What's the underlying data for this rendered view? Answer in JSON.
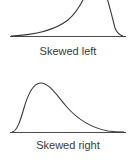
{
  "diagrams": [
    {
      "id": "skewed-left",
      "label": "Skewed left",
      "shape": "left-skewed density curve (long tail to the left, peak on the right)"
    },
    {
      "id": "skewed-right",
      "label": "Skewed right",
      "shape": "right-skewed density curve (peak on the left, long tail to the right)"
    }
  ],
  "colors": {
    "curve": "#3a3a3a",
    "axis": "#4a4a4a",
    "text": "#3a3a3a",
    "background": "#ffffff"
  }
}
